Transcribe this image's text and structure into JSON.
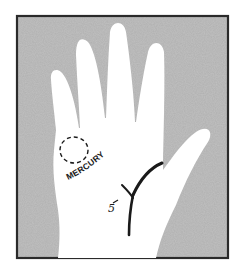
{
  "figure": {
    "type": "palmistry-hand-diagram",
    "frame": {
      "x": 17,
      "y": 16,
      "width": 211,
      "height": 242,
      "border_color": "#2a2a2a",
      "background_color": "#a9a9a9"
    },
    "hand_color": "#ffffff",
    "line_color": "#1a1a1a"
  },
  "labels": {
    "mount": "MERCURY",
    "line_marker": "5"
  }
}
